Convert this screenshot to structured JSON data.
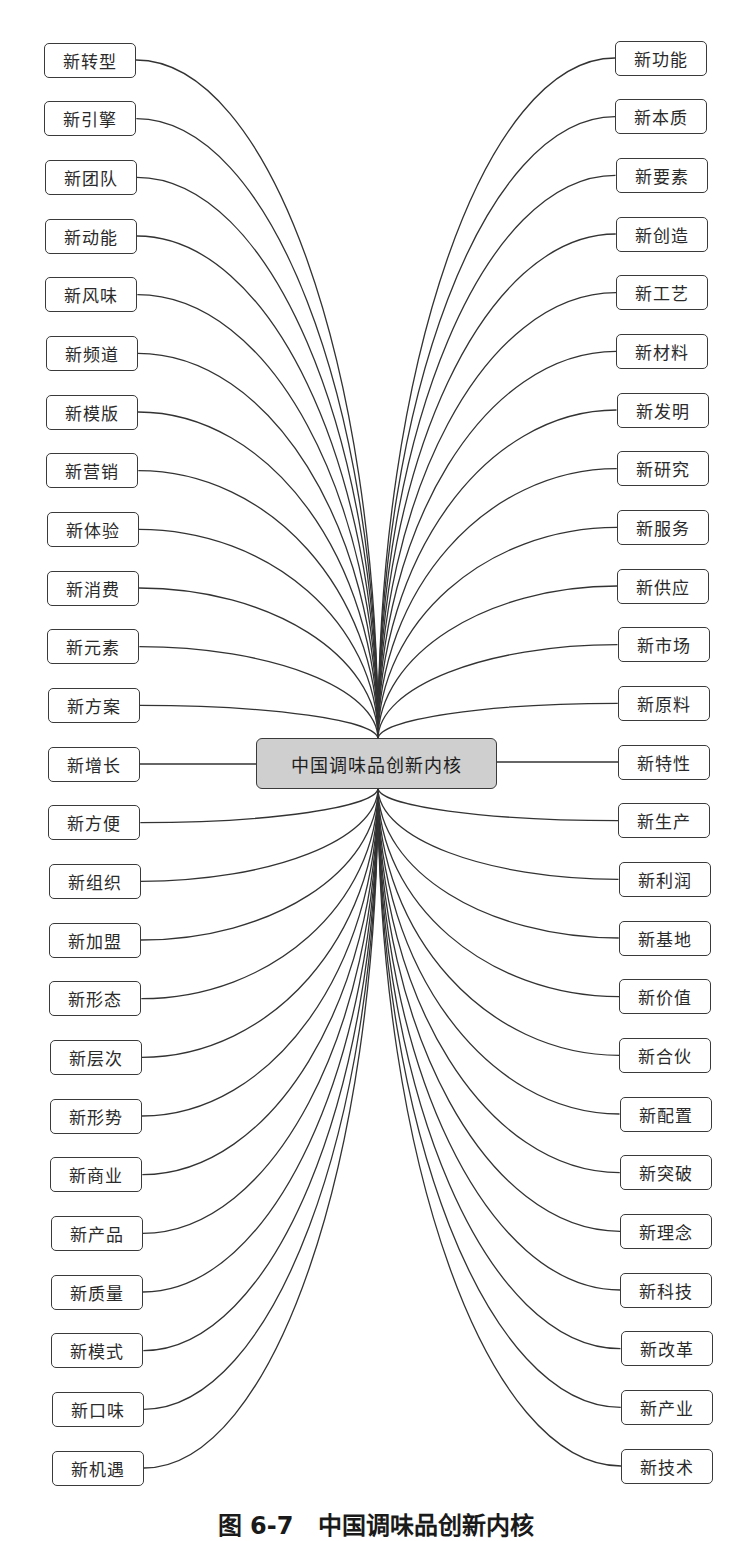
{
  "diagram": {
    "center": {
      "label": "中国调味品创新内核",
      "fill": "#cfcfcf"
    },
    "left_nodes": [
      "新转型",
      "新引擎",
      "新团队",
      "新动能",
      "新风味",
      "新频道",
      "新模版",
      "新营销",
      "新体验",
      "新消费",
      "新元素",
      "新方案",
      "新增长",
      "新方便",
      "新组织",
      "新加盟",
      "新形态",
      "新层次",
      "新形势",
      "新商业",
      "新产品",
      "新质量",
      "新模式",
      "新口味",
      "新机遇"
    ],
    "right_nodes": [
      "新功能",
      "新本质",
      "新要素",
      "新创造",
      "新工艺",
      "新材料",
      "新发明",
      "新研究",
      "新服务",
      "新供应",
      "新市场",
      "新原料",
      "新特性",
      "新生产",
      "新利润",
      "新基地",
      "新价值",
      "新合伙",
      "新配置",
      "新突破",
      "新理念",
      "新科技",
      "新改革",
      "新产业",
      "新技术"
    ]
  },
  "caption": "图 6-7   中国调味品创新内核"
}
